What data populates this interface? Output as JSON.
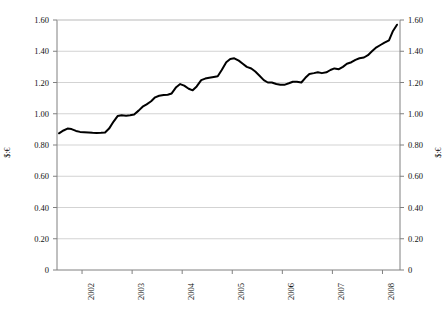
{
  "chart_data": {
    "type": "line",
    "title": "",
    "subtitle": "",
    "xlabel": "",
    "ylabel": "$:€",
    "ylabel_right": "$:€",
    "ylim": [
      0,
      1.6
    ],
    "xlim": [
      2001.5,
      2008.35
    ],
    "grid": "horizontal",
    "legend": "none",
    "line_color": "#000000",
    "grid_color": "#c8c8c8",
    "axis_color": "#808080",
    "y_ticks": [
      "0",
      "0.20",
      "0.40",
      "0.60",
      "0.80",
      "1.00",
      "1.20",
      "1.40",
      "1.60"
    ],
    "y_tick_values": [
      0,
      0.2,
      0.4,
      0.6,
      0.8,
      1.0,
      1.2,
      1.4,
      1.6
    ],
    "x_ticks": [
      "2002",
      "2003",
      "2004",
      "2005",
      "2006",
      "2007",
      "2008"
    ],
    "x_tick_values": [
      2002,
      2003,
      2004,
      2005,
      2006,
      2007,
      2008
    ],
    "series": [
      {
        "name": "$:€ exchange rate",
        "x": [
          2001.54,
          2001.63,
          2001.71,
          2001.79,
          2001.88,
          2001.96,
          2002.04,
          2002.13,
          2002.21,
          2002.29,
          2002.38,
          2002.46,
          2002.54,
          2002.63,
          2002.71,
          2002.79,
          2002.88,
          2002.96,
          2003.04,
          2003.13,
          2003.21,
          2003.29,
          2003.38,
          2003.46,
          2003.54,
          2003.63,
          2003.71,
          2003.79,
          2003.88,
          2003.96,
          2004.04,
          2004.13,
          2004.21,
          2004.29,
          2004.38,
          2004.46,
          2004.54,
          2004.63,
          2004.71,
          2004.79,
          2004.88,
          2004.96,
          2005.04,
          2005.13,
          2005.21,
          2005.29,
          2005.38,
          2005.46,
          2005.54,
          2005.63,
          2005.71,
          2005.79,
          2005.88,
          2005.96,
          2006.04,
          2006.13,
          2006.21,
          2006.29,
          2006.38,
          2006.46,
          2006.54,
          2006.63,
          2006.71,
          2006.79,
          2006.88,
          2006.96,
          2007.04,
          2007.13,
          2007.21,
          2007.29,
          2007.38,
          2007.46,
          2007.54,
          2007.63,
          2007.71,
          2007.79,
          2007.88,
          2007.96,
          2008.04,
          2008.13,
          2008.21,
          2008.29
        ],
        "values": [
          0.875,
          0.893,
          0.905,
          0.902,
          0.89,
          0.884,
          0.882,
          0.88,
          0.878,
          0.877,
          0.878,
          0.88,
          0.905,
          0.95,
          0.985,
          0.99,
          0.988,
          0.99,
          0.995,
          1.02,
          1.045,
          1.06,
          1.08,
          1.105,
          1.115,
          1.12,
          1.122,
          1.13,
          1.17,
          1.19,
          1.18,
          1.16,
          1.15,
          1.175,
          1.215,
          1.225,
          1.23,
          1.235,
          1.24,
          1.28,
          1.33,
          1.35,
          1.355,
          1.34,
          1.32,
          1.3,
          1.29,
          1.27,
          1.245,
          1.215,
          1.2,
          1.2,
          1.19,
          1.185,
          1.185,
          1.195,
          1.205,
          1.205,
          1.2,
          1.23,
          1.255,
          1.26,
          1.265,
          1.26,
          1.265,
          1.28,
          1.29,
          1.285,
          1.3,
          1.32,
          1.33,
          1.345,
          1.355,
          1.36,
          1.375,
          1.4,
          1.425,
          1.44,
          1.455,
          1.47,
          1.53,
          1.57
        ]
      }
    ]
  }
}
